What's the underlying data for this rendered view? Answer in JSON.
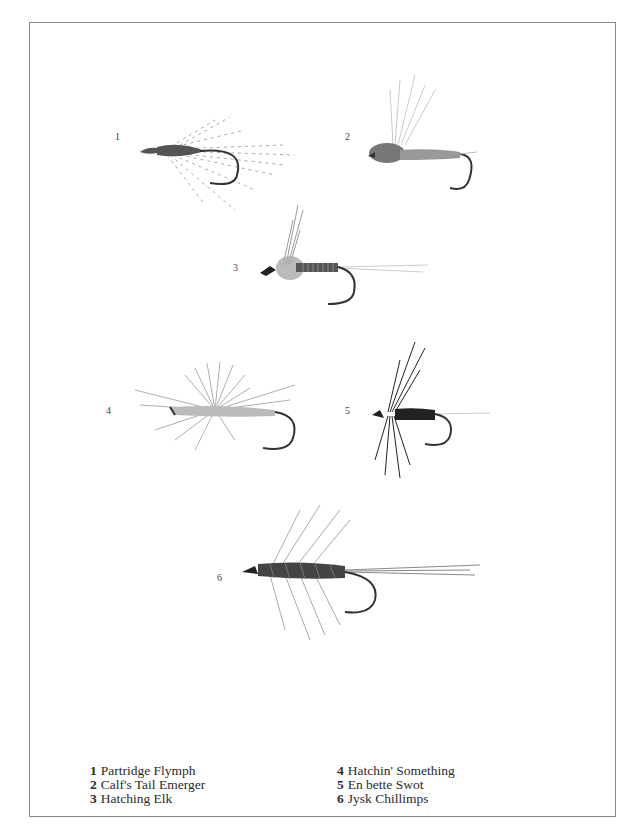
{
  "plate": {
    "flies": [
      {
        "number": "1",
        "name": "Partridge Flymph"
      },
      {
        "number": "2",
        "name": "Calf's Tail Emerger"
      },
      {
        "number": "3",
        "name": "Hatching Elk"
      },
      {
        "number": "4",
        "name": "Hatchin' Something"
      },
      {
        "number": "5",
        "name": "En bette Swot"
      },
      {
        "number": "6",
        "name": "Jysk Chillimps"
      }
    ]
  },
  "captions": {
    "left": [
      {
        "number": "1",
        "name": "Partridge Flymph"
      },
      {
        "number": "2",
        "name": "Calf's Tail Emerger"
      },
      {
        "number": "3",
        "name": "Hatching Elk"
      }
    ],
    "right": [
      {
        "number": "4",
        "name": "Hatchin' Something"
      },
      {
        "number": "5",
        "name": "En bette Swot"
      },
      {
        "number": "6",
        "name": "Jysk Chillimps"
      }
    ]
  },
  "colors": {
    "border": "#8a8a8a",
    "ink": "#2a2a2a",
    "hackle": "#9a9a9a"
  }
}
